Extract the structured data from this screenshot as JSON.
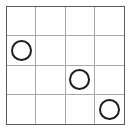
{
  "board": {
    "title": "4x4 grid with circles",
    "rows": 4,
    "columns": 4,
    "background_color": "#ffffff",
    "outer_border_color": "#5a5a5a",
    "grid_line_color": "#a8a8a8",
    "token_stroke_color": "#1c1c1c",
    "token_fill_color": "transparent",
    "token_shape": "circle-outline",
    "cells": [
      [
        {
          "row": 1,
          "col": 1,
          "token": ""
        },
        {
          "row": 1,
          "col": 2,
          "token": ""
        },
        {
          "row": 1,
          "col": 3,
          "token": ""
        },
        {
          "row": 1,
          "col": 4,
          "token": ""
        }
      ],
      [
        {
          "row": 2,
          "col": 1,
          "token": "circle"
        },
        {
          "row": 2,
          "col": 2,
          "token": ""
        },
        {
          "row": 2,
          "col": 3,
          "token": ""
        },
        {
          "row": 2,
          "col": 4,
          "token": ""
        }
      ],
      [
        {
          "row": 3,
          "col": 1,
          "token": ""
        },
        {
          "row": 3,
          "col": 2,
          "token": ""
        },
        {
          "row": 3,
          "col": 3,
          "token": "circle"
        },
        {
          "row": 3,
          "col": 4,
          "token": ""
        }
      ],
      [
        {
          "row": 4,
          "col": 1,
          "token": ""
        },
        {
          "row": 4,
          "col": 2,
          "token": ""
        },
        {
          "row": 4,
          "col": 3,
          "token": ""
        },
        {
          "row": 4,
          "col": 4,
          "token": "circle"
        }
      ]
    ],
    "token_positions": [
      {
        "row": 2,
        "col": 1
      },
      {
        "row": 3,
        "col": 3
      },
      {
        "row": 4,
        "col": 4
      }
    ],
    "token_count": 3
  }
}
